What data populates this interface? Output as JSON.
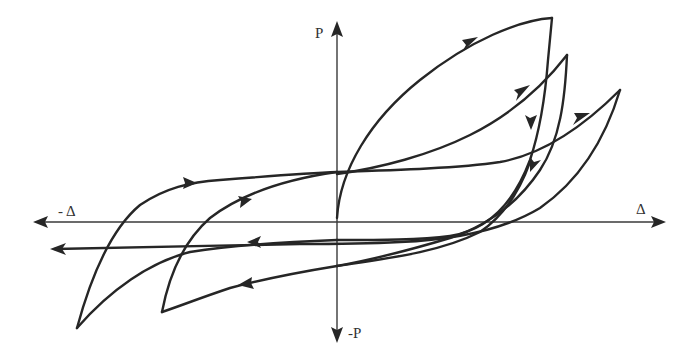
{
  "diagram": {
    "type": "hysteresis-loop",
    "axes": {
      "y_positive_label": "P",
      "y_negative_label": "-P",
      "x_positive_label": "Δ",
      "x_negative_label": "- Δ"
    },
    "colors": {
      "curve": "#262626",
      "axis": "#3a3a3a",
      "background": "#ffffff"
    },
    "loops": [
      {
        "name": "cycle-1",
        "peak_positive": "highest",
        "peak_negative": "mid"
      },
      {
        "name": "cycle-2",
        "peak_positive": "middle",
        "peak_negative": "low"
      },
      {
        "name": "cycle-3",
        "peak_positive": "rightmost",
        "peak_negative": "leftmost"
      }
    ]
  }
}
